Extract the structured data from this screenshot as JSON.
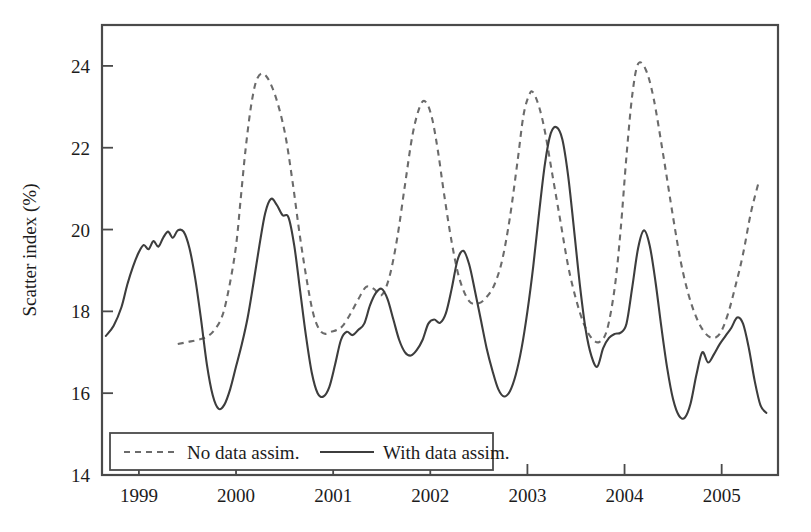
{
  "chart_data": {
    "type": "line",
    "title": "",
    "subtitle": "",
    "xlabel": "",
    "ylabel": "Scatter index (%)",
    "xlim": [
      1998.62,
      2005.58
    ],
    "ylim": [
      14,
      25
    ],
    "y_ticks": [
      14,
      16,
      18,
      20,
      22,
      24
    ],
    "y_tick_labels": [
      "14",
      "16",
      "18",
      "20",
      "22",
      "24"
    ],
    "x_ticks": [
      1999,
      2000,
      2001,
      2002,
      2003,
      2004,
      2005
    ],
    "x_tick_labels": [
      "1999",
      "2000",
      "2001",
      "2002",
      "2003",
      "2004",
      "2005"
    ],
    "grid": false,
    "legend_position": "lower-left-inside",
    "frame": true,
    "series": [
      {
        "name": "No data assim.",
        "style": "dashed",
        "color": "#6b6b6b",
        "x": [
          1999.4,
          1999.5,
          1999.6,
          1999.7,
          1999.78,
          1999.86,
          1999.93,
          2000.0,
          2000.05,
          2000.1,
          2000.16,
          2000.22,
          2000.3,
          2000.4,
          2000.5,
          2000.58,
          2000.66,
          2000.74,
          2000.8,
          2000.86,
          2000.92,
          2000.98,
          2001.04,
          2001.1,
          2001.18,
          2001.26,
          2001.34,
          2001.42,
          2001.5,
          2001.58,
          2001.66,
          2001.74,
          2001.82,
          2001.9,
          2001.96,
          2002.02,
          2002.08,
          2002.14,
          2002.22,
          2002.3,
          2002.4,
          2002.5,
          2002.58,
          2002.66,
          2002.74,
          2002.82,
          2002.9,
          2002.96,
          2003.02,
          2003.06,
          2003.12,
          2003.18,
          2003.26,
          2003.34,
          2003.42,
          2003.5,
          2003.58,
          2003.66,
          2003.74,
          2003.82,
          2003.9,
          2003.96,
          2004.02,
          2004.08,
          2004.14,
          2004.22,
          2004.3,
          2004.4,
          2004.5,
          2004.58,
          2004.66,
          2004.74,
          2004.82,
          2004.9,
          2004.98,
          2005.06,
          2005.14,
          2005.22,
          2005.3,
          2005.38
        ],
        "y": [
          17.2,
          17.25,
          17.3,
          17.38,
          17.55,
          17.9,
          18.6,
          19.6,
          20.8,
          22.0,
          23.1,
          23.7,
          23.78,
          23.3,
          22.4,
          21.2,
          19.8,
          18.6,
          17.9,
          17.55,
          17.45,
          17.5,
          17.55,
          17.65,
          17.95,
          18.3,
          18.6,
          18.55,
          18.4,
          18.85,
          19.8,
          21.1,
          22.35,
          23.05,
          23.1,
          22.7,
          21.9,
          20.9,
          19.7,
          18.8,
          18.25,
          18.2,
          18.35,
          18.65,
          19.25,
          20.3,
          21.7,
          22.8,
          23.3,
          23.35,
          23.0,
          22.4,
          21.3,
          20.2,
          19.1,
          18.3,
          17.7,
          17.35,
          17.25,
          17.55,
          18.6,
          20.0,
          21.8,
          23.3,
          24.05,
          23.9,
          23.2,
          21.8,
          20.3,
          19.2,
          18.4,
          17.85,
          17.5,
          17.35,
          17.45,
          17.9,
          18.6,
          19.4,
          20.4,
          21.15
        ]
      },
      {
        "name": "With data assim.",
        "style": "solid",
        "color": "#3d3d3d",
        "x": [
          1998.66,
          1998.74,
          1998.82,
          1998.88,
          1998.94,
          1999.0,
          1999.05,
          1999.1,
          1999.15,
          1999.2,
          1999.25,
          1999.3,
          1999.35,
          1999.4,
          1999.46,
          1999.52,
          1999.58,
          1999.64,
          1999.7,
          1999.76,
          1999.82,
          1999.88,
          1999.94,
          2000.0,
          2000.06,
          2000.12,
          2000.18,
          2000.24,
          2000.3,
          2000.36,
          2000.42,
          2000.48,
          2000.54,
          2000.6,
          2000.66,
          2000.72,
          2000.78,
          2000.84,
          2000.9,
          2000.96,
          2001.02,
          2001.08,
          2001.14,
          2001.2,
          2001.26,
          2001.32,
          2001.38,
          2001.44,
          2001.5,
          2001.56,
          2001.62,
          2001.68,
          2001.74,
          2001.8,
          2001.86,
          2001.92,
          2001.98,
          2002.04,
          2002.1,
          2002.16,
          2002.22,
          2002.28,
          2002.34,
          2002.4,
          2002.46,
          2002.52,
          2002.58,
          2002.64,
          2002.7,
          2002.76,
          2002.82,
          2002.88,
          2002.94,
          2003.0,
          2003.06,
          2003.12,
          2003.18,
          2003.24,
          2003.3,
          2003.36,
          2003.42,
          2003.48,
          2003.54,
          2003.6,
          2003.66,
          2003.72,
          2003.78,
          2003.84,
          2003.9,
          2003.96,
          2004.02,
          2004.08,
          2004.14,
          2004.2,
          2004.26,
          2004.32,
          2004.38,
          2004.44,
          2004.5,
          2004.56,
          2004.62,
          2004.68,
          2004.74,
          2004.8,
          2004.86,
          2004.92,
          2004.98,
          2005.04,
          2005.1,
          2005.16,
          2005.22,
          2005.28,
          2005.34,
          2005.4,
          2005.46
        ],
        "y": [
          17.4,
          17.65,
          18.1,
          18.65,
          19.1,
          19.45,
          19.62,
          19.52,
          19.72,
          19.58,
          19.8,
          19.95,
          19.8,
          19.98,
          19.95,
          19.55,
          18.8,
          17.8,
          16.7,
          15.95,
          15.62,
          15.72,
          16.1,
          16.65,
          17.2,
          17.85,
          18.7,
          19.6,
          20.4,
          20.75,
          20.6,
          20.35,
          20.3,
          19.6,
          18.5,
          17.4,
          16.5,
          16.0,
          15.92,
          16.15,
          16.7,
          17.3,
          17.5,
          17.42,
          17.55,
          17.7,
          18.15,
          18.45,
          18.55,
          18.3,
          17.8,
          17.3,
          17.0,
          16.92,
          17.05,
          17.3,
          17.7,
          17.8,
          17.72,
          17.95,
          18.55,
          19.25,
          19.48,
          19.15,
          18.5,
          17.8,
          17.1,
          16.55,
          16.1,
          15.92,
          16.05,
          16.45,
          17.1,
          18.0,
          19.1,
          20.4,
          21.6,
          22.35,
          22.5,
          22.2,
          21.3,
          20.0,
          18.65,
          17.55,
          16.9,
          16.65,
          17.1,
          17.35,
          17.45,
          17.48,
          17.7,
          18.6,
          19.55,
          19.98,
          19.6,
          18.7,
          17.6,
          16.6,
          15.85,
          15.45,
          15.4,
          15.75,
          16.45,
          17.0,
          16.75,
          16.95,
          17.2,
          17.4,
          17.6,
          17.85,
          17.7,
          17.1,
          16.3,
          15.7,
          15.52
        ]
      }
    ]
  },
  "legend": {
    "items": [
      {
        "label": "No data assim.",
        "style": "dashed"
      },
      {
        "label": "With data assim.",
        "style": "solid"
      }
    ]
  }
}
